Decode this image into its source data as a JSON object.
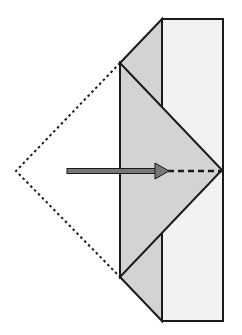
{
  "diagram": {
    "title": "",
    "colors": {
      "background": "#ffffff",
      "stroke": "#1a1a1a",
      "rect_fill": "#f2f2f2",
      "shape_fill": "#d3d3d3",
      "arrow_fill": "#777777"
    },
    "rectangle": {
      "x": 162,
      "y": 19,
      "width": 61,
      "height": 302
    },
    "left_trapezoid": {
      "points": "162,19 120,63 120,277 162,321"
    },
    "triangle": {
      "points": "120,63 222,170 120,277"
    },
    "dotted_outline": {
      "points": "120,63 16,171 120,277"
    },
    "arrow": {
      "x1": 67,
      "y1": 171,
      "x2": 168,
      "y2": 171
    },
    "dashed_extension": {
      "x1": 168,
      "y1": 171,
      "x2": 222,
      "y2": 171
    }
  }
}
